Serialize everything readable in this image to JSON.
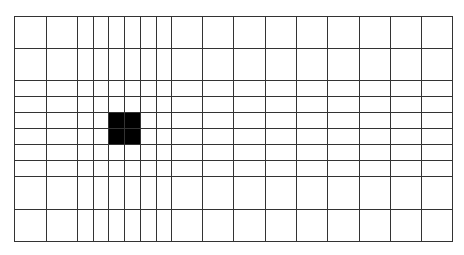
{
  "grid": {
    "line_color": "#333333",
    "background": "#ffffff",
    "x_lines": [
      14,
      46,
      77,
      93,
      108,
      124,
      140,
      156,
      171,
      202,
      233,
      265,
      296,
      327,
      359,
      390,
      421,
      452
    ],
    "y_lines": [
      16,
      48,
      80,
      96,
      112,
      128,
      144,
      160,
      176,
      209,
      241
    ],
    "filled_cells": [
      {
        "x0": 108,
        "y0": 112,
        "x1": 140,
        "y1": 144,
        "color": "#000000"
      }
    ]
  }
}
